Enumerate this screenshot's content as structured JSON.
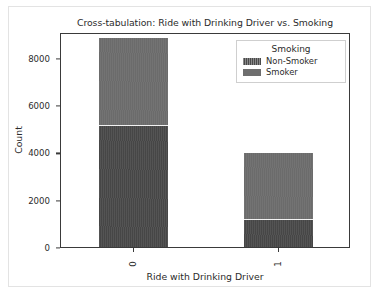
{
  "chart_data": {
    "type": "bar",
    "barmode": "stacked",
    "title": "Cross-tabulation: Ride with Drinking Driver vs. Smoking",
    "xlabel": "Ride with Drinking Driver",
    "ylabel": "Count",
    "categories": [
      "0",
      "1"
    ],
    "series": [
      {
        "name": "Non-Smoker",
        "values": [
          5130,
          1130
        ],
        "color": "#4a4a4a"
      },
      {
        "name": "Smoker",
        "values": [
          3700,
          2850
        ],
        "color": "#6e6e6e"
      }
    ],
    "totals": [
      8830,
      3980
    ],
    "ylim": [
      0,
      9100
    ],
    "yticks": [
      0,
      2000,
      4000,
      6000,
      8000
    ],
    "ytick_labels": [
      "0",
      "2000",
      "4000",
      "6000",
      "8000"
    ],
    "xtick_labels": [
      "0",
      "1"
    ],
    "xtick_rotation": 90,
    "grid": false,
    "legend": {
      "title": "Smoking",
      "position": "upper right",
      "entries": [
        "Non-Smoker",
        "Smoker"
      ]
    }
  },
  "figure": {
    "background": "#ffffff",
    "axes_color": "#3a3a3a",
    "text_color": "#2b2b2b"
  }
}
